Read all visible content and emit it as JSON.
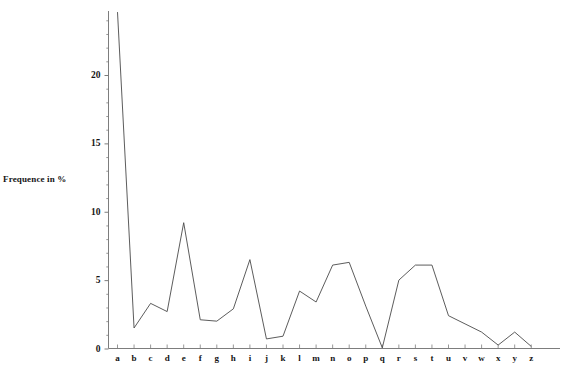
{
  "top_fragment": {
    "text": "—— —— — ——— — —— —— — — —— — — —— — ——"
  },
  "axis": {
    "y_label": "Frequence in %",
    "y_ticks_major": [
      "0",
      "5",
      "10",
      "15",
      "20"
    ],
    "x_label": ""
  },
  "chart_data": {
    "type": "line",
    "title": "",
    "subtitle": "",
    "xlabel": "",
    "ylabel": "Frequence in %",
    "xlim": [
      0,
      27
    ],
    "ylim": [
      0,
      24.8
    ],
    "grid": false,
    "legend": false,
    "legend_position": "none",
    "y_major_ticks": [
      0,
      5,
      10,
      15,
      20
    ],
    "y_minor_tick_step": 1,
    "categories": [
      "a",
      "b",
      "c",
      "d",
      "e",
      "f",
      "g",
      "h",
      "i",
      "j",
      "k",
      "l",
      "m",
      "n",
      "o",
      "p",
      "q",
      "r",
      "s",
      "t",
      "u",
      "v",
      "w",
      "x",
      "y",
      "z"
    ],
    "values": [
      24.6,
      1.5,
      3.3,
      2.7,
      9.2,
      2.1,
      2.0,
      2.9,
      6.5,
      0.7,
      0.9,
      4.2,
      3.4,
      6.1,
      6.3,
      3.1,
      0.05,
      5.0,
      6.1,
      6.1,
      2.4,
      1.8,
      1.2,
      0.25,
      1.2,
      0.15
    ],
    "series": [
      {
        "name": "letter frequency",
        "color": "#4a4a4a",
        "values": [
          24.6,
          1.5,
          3.3,
          2.7,
          9.2,
          2.1,
          2.0,
          2.9,
          6.5,
          0.7,
          0.9,
          4.2,
          3.4,
          6.1,
          6.3,
          3.1,
          0.05,
          5.0,
          6.1,
          6.1,
          2.4,
          1.8,
          1.2,
          0.25,
          1.2,
          0.15
        ]
      }
    ],
    "annotations": [],
    "note": "first data point for letter 'a' is clipped by the top edge of the plotting area"
  },
  "colors": {
    "line": "#4a4a4a",
    "axis": "#7d7d7d",
    "text": "#151515",
    "background": "#ffffff"
  }
}
